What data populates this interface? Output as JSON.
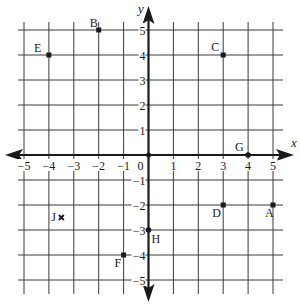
{
  "diagram": {
    "type": "coordinate-plane",
    "axes": {
      "x_label": "x",
      "y_label": "y",
      "x_range": [
        -5,
        5
      ],
      "y_range": [
        -5,
        5
      ],
      "x_ticks": [
        "-5",
        "-4",
        "-3",
        "-2",
        "-1",
        "0",
        "1",
        "2",
        "3",
        "4",
        "5"
      ],
      "y_ticks": [
        "5",
        "4",
        "3",
        "2",
        "1",
        "-1",
        "-2",
        "-3",
        "-4",
        "-5"
      ],
      "origin_label": "0"
    },
    "grid": true,
    "points": [
      {
        "label": "A",
        "x": 5,
        "y": -2,
        "marker": "square"
      },
      {
        "label": "B",
        "x": -2,
        "y": 5,
        "marker": "square"
      },
      {
        "label": "C",
        "x": 3,
        "y": 4,
        "marker": "square"
      },
      {
        "label": "D",
        "x": 3,
        "y": -2,
        "marker": "square"
      },
      {
        "label": "E",
        "x": -4,
        "y": 4,
        "marker": "square"
      },
      {
        "label": "F",
        "x": -1,
        "y": -4,
        "marker": "square"
      },
      {
        "label": "G",
        "x": 4,
        "y": 0,
        "marker": "dot"
      },
      {
        "label": "H",
        "x": 0,
        "y": -3,
        "marker": "dot"
      },
      {
        "label": "J",
        "x": -3.5,
        "y": -2.5,
        "marker": "x"
      }
    ],
    "colors": {
      "ink": "#1a1a1a",
      "grid": "#3a3a3a",
      "background": "#ffffff"
    }
  }
}
